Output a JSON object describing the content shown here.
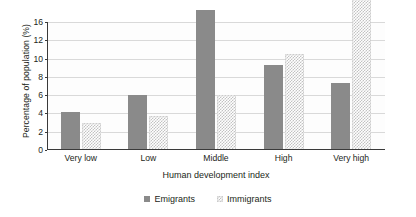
{
  "chart_data": {
    "type": "bar",
    "title": "",
    "xlabel": "Human development index",
    "ylabel": "Percentage of population (%)",
    "categories": [
      "Very low",
      "Low",
      "Middle",
      "High",
      "Very high"
    ],
    "series": [
      {
        "name": "Emigrants",
        "values": [
          4.2,
          6.0,
          15.3,
          9.3,
          7.3
        ]
      },
      {
        "name": "Immigrants",
        "values": [
          3.0,
          3.7,
          6.0,
          10.5,
          17.8
        ]
      }
    ],
    "ytick_labels": [
      "0",
      "2",
      "4",
      "6",
      "8",
      "10",
      "12",
      "16"
    ],
    "ytick_positions": [
      0,
      2,
      4,
      6,
      8,
      10,
      12,
      14
    ],
    "ylim": [
      0,
      18
    ],
    "grid": "horizontal",
    "legend_position": "bottom",
    "colors": {
      "emigrants": "#8a8a8a",
      "immigrants": "#c2c2c2",
      "gridline": "#d9d9d9",
      "axis": "#3a3a3a",
      "text": "#231f20",
      "background": "#ffffff"
    }
  }
}
